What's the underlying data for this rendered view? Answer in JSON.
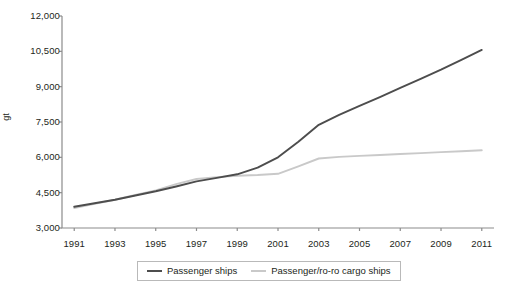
{
  "chart_data": {
    "type": "line",
    "title": "",
    "xlabel": "",
    "ylabel": "gt",
    "x": [
      1991,
      1992,
      1993,
      1994,
      1995,
      1996,
      1997,
      1998,
      1999,
      2000,
      2001,
      2002,
      2003,
      2004,
      2005,
      2006,
      2007,
      2008,
      2009,
      2010,
      2011
    ],
    "xlim": [
      1990.4,
      2011.6
    ],
    "ylim": [
      3000,
      12000
    ],
    "yticks": [
      3000,
      4500,
      6000,
      7500,
      9000,
      10500,
      12000
    ],
    "ytick_labels": [
      "3,000",
      "4,500",
      "6,000",
      "7,500",
      "9,000",
      "10,500",
      "12,000"
    ],
    "xticks": [
      1991,
      1993,
      1995,
      1997,
      1999,
      2001,
      2003,
      2005,
      2007,
      2009,
      2011
    ],
    "xtick_labels": [
      "1991",
      "1993",
      "1995",
      "1997",
      "1999",
      "2001",
      "2003",
      "2005",
      "2007",
      "2009",
      "2011"
    ],
    "grid": false,
    "legend_position": "bottom",
    "series": [
      {
        "name": "Passenger ships",
        "color": "#4d4d4d",
        "values": [
          3900,
          4050,
          4200,
          4380,
          4560,
          4760,
          4980,
          5130,
          5280,
          5560,
          6000,
          6660,
          7380,
          7800,
          8180,
          8560,
          8950,
          9330,
          9720,
          10140,
          10560
        ]
      },
      {
        "name": "Passenger/ro-ro cargo ships",
        "color": "#c9c9c9",
        "values": [
          3850,
          4030,
          4200,
          4400,
          4600,
          4860,
          5080,
          5160,
          5220,
          5250,
          5300,
          5620,
          5950,
          6020,
          6060,
          6100,
          6140,
          6180,
          6220,
          6260,
          6300
        ]
      }
    ]
  },
  "legend": {
    "items": [
      {
        "label": "Passenger ships",
        "color": "#4d4d4d"
      },
      {
        "label": "Passenger/ro-ro cargo ships",
        "color": "#c9c9c9"
      }
    ]
  },
  "axes": {
    "axis_color": "#8c8c8c"
  }
}
